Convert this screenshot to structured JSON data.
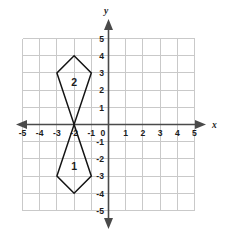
{
  "chart_data": {
    "type": "scatter",
    "title": "",
    "xlabel": "x",
    "ylabel": "y",
    "xlim": [
      -5.8,
      5.8
    ],
    "ylim": [
      -5.8,
      5.8
    ],
    "grid": true,
    "legend": "none",
    "x_tick_labels": [
      "-5",
      "-4",
      "-3",
      "-2",
      "-1",
      "0",
      "1",
      "2",
      "3",
      "4",
      "5"
    ],
    "x_tick_values": [
      -5,
      -4,
      -3,
      -2,
      -1,
      0,
      1,
      2,
      3,
      4,
      5
    ],
    "y_tick_labels": [
      "5",
      "4",
      "3",
      "2",
      "1",
      "0",
      "-1",
      "-2",
      "-3",
      "-4",
      "-5"
    ],
    "y_tick_values": [
      5,
      4,
      3,
      2,
      1,
      0,
      -1,
      -2,
      -3,
      -4,
      -5
    ],
    "origin_label": "0",
    "annotations": [
      {
        "text": "2",
        "x": -2,
        "y": 2.45
      },
      {
        "text": "1",
        "x": -2,
        "y": -2.45
      }
    ],
    "shapes": [
      {
        "name": "figure-2",
        "label": "2",
        "closed": true,
        "vertices": [
          [
            -2,
            4
          ],
          [
            -1,
            3
          ],
          [
            -2,
            0
          ],
          [
            -3,
            3
          ]
        ]
      },
      {
        "name": "figure-1",
        "label": "1",
        "closed": true,
        "vertices": [
          [
            -2,
            0
          ],
          [
            -1,
            -3
          ],
          [
            -2,
            -4
          ],
          [
            -3,
            -3
          ]
        ]
      }
    ]
  },
  "colors": {
    "background": "#ffffff",
    "grid": "#c9c9c9",
    "axis": "#4a4a4a",
    "shape_stroke": "#141414",
    "text": "#1c1c1c"
  },
  "axis_labels": {
    "x": "x",
    "y": "y"
  }
}
